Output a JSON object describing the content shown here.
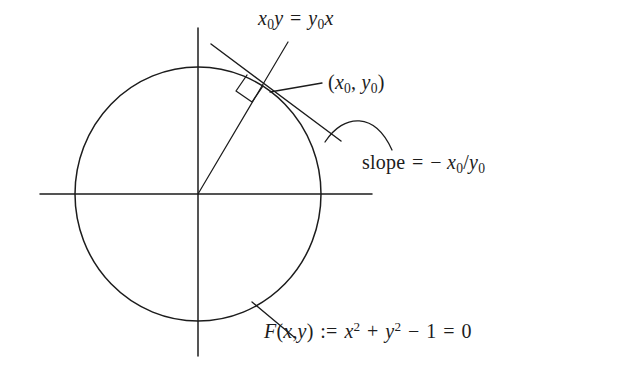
{
  "figure": {
    "kind": "geometry-diagram",
    "title_text": "",
    "background_color": "#ffffff",
    "stroke_color": "#1c1c1c",
    "labels": {
      "tangent_line_equation": "x₀y = y₀x",
      "point_label": "(x₀, y₀)",
      "slope_label": "slope = − x₀/y₀",
      "curve_equation": "F(x,y) := x² + y² − 1 = 0"
    },
    "label_parts": {
      "tangent_line_equation": {
        "lhs_var": "x",
        "lhs_sub": "0",
        "lhs_var2": "y",
        "relation": "=",
        "rhs_var": "y",
        "rhs_sub": "0",
        "rhs_var2": "x"
      },
      "point_label": {
        "open": "(",
        "x_var": "x",
        "x_sub": "0",
        "comma": ",",
        "y_var": "y",
        "y_sub": "0",
        "close": ")"
      },
      "slope_label": {
        "word": "slope",
        "relation": "=",
        "minus": "−",
        "num_var": "x",
        "num_sub": "0",
        "slash": "/",
        "den_var": "y",
        "den_sub": "0"
      },
      "curve_equation": {
        "fn": "F",
        "open": "(",
        "arg1": "x",
        "comma": ",",
        "arg2": "y",
        "close": ")",
        "defines": ":=",
        "t1_var": "x",
        "t1_exp": "2",
        "plus": "+",
        "t2_var": "y",
        "t2_exp": "2",
        "minus": "−",
        "one": "1",
        "equals": "=",
        "zero": "0"
      }
    },
    "geometry": {
      "origin": [
        198,
        194
      ],
      "circle_center": [
        198,
        194
      ],
      "circle_radius_x": 123,
      "circle_radius_y": 127,
      "x_axis": [
        40,
        194,
        372,
        194
      ],
      "y_axis": [
        198,
        28,
        198,
        356
      ],
      "tangent_point": [
        268,
        93
      ],
      "radius_line": [
        198,
        194,
        288,
        42
      ],
      "tangent_line": [
        211,
        44,
        341,
        141
      ],
      "right_angle_marker_size": 14,
      "leader_point_label": [
        270,
        92,
        320,
        84
      ],
      "leader_slope_arc": [
        327,
        143,
        365,
        118,
        392,
        149
      ],
      "leader_curve_eq": [
        252,
        303,
        293,
        336
      ]
    }
  }
}
